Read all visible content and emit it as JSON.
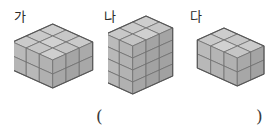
{
  "worksheet": {
    "type": "cube-stack-comparison",
    "background_color": "#ffffff",
    "figures": [
      {
        "label": "가",
        "width_cubes": 3,
        "depth_cubes": 3,
        "height_cubes": 2,
        "total_cubes": 18
      },
      {
        "label": "나",
        "width_cubes": 3,
        "depth_cubes": 2,
        "height_cubes": 4,
        "total_cubes": 24
      },
      {
        "label": "다",
        "width_cubes": 3,
        "depth_cubes": 2,
        "height_cubes": 2,
        "total_cubes": 12
      }
    ],
    "answer_blank": {
      "open_paren": "(",
      "close_paren": ")",
      "value": ""
    },
    "colors": {
      "top_face": "#c9c9c9",
      "front_face": "#b4b4b4",
      "side_face": "#a8a8a8",
      "outline": "#585858",
      "grid_line": "#6e6e6e",
      "text": "#2a2a2a"
    }
  }
}
